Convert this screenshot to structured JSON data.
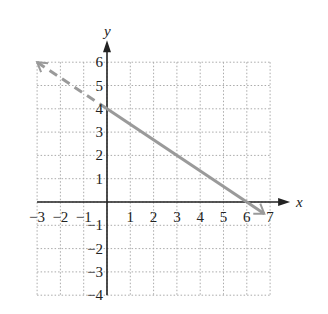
{
  "chart_data": {
    "type": "line",
    "title": "",
    "xlabel": "x",
    "ylabel": "y",
    "xlim": [
      -3,
      7
    ],
    "ylim": [
      -4,
      6
    ],
    "grid": true,
    "x_ticks": [
      "-3",
      "-2",
      "-1",
      "1",
      "2",
      "3",
      "4",
      "5",
      "6",
      "7"
    ],
    "y_ticks": [
      "6",
      "5",
      "4",
      "3",
      "2",
      "1",
      "-1",
      "-2",
      "-3",
      "-4"
    ],
    "series": [
      {
        "name": "solid segment",
        "style": "solid",
        "x": [
          0,
          6
        ],
        "y": [
          4,
          0
        ],
        "color": "#9a9a9a"
      },
      {
        "name": "dashed extension left",
        "style": "dashed",
        "x": [
          -3,
          0
        ],
        "y": [
          6,
          4
        ],
        "color": "#9a9a9a"
      },
      {
        "name": "arrow extension right",
        "style": "solid",
        "x": [
          6,
          6.75
        ],
        "y": [
          0,
          -0.5
        ],
        "color": "#9a9a9a"
      }
    ],
    "equation_implied": "y = -2/3 x + 4"
  }
}
